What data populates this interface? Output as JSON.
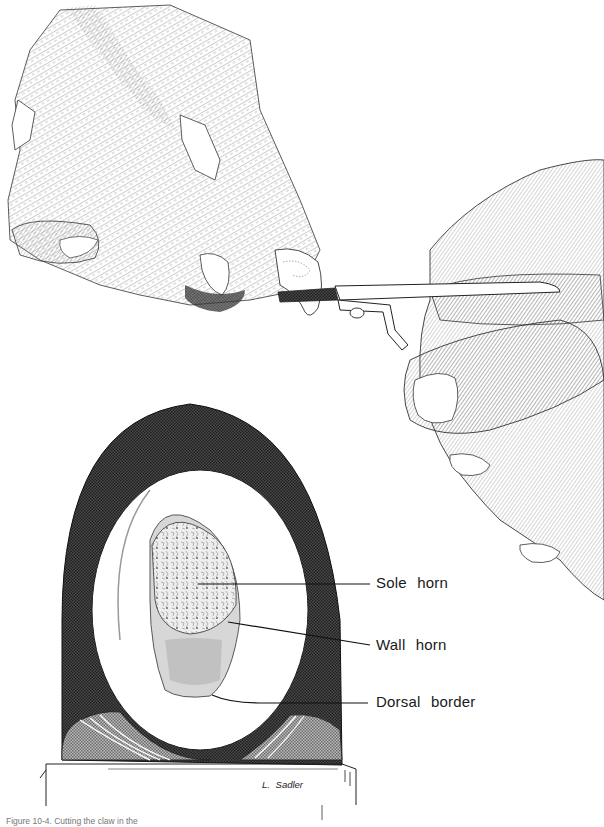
{
  "figure": {
    "upper_illustration": "Dog paw with claw being cut by nail clippers held in a human hand",
    "lower_illustration": "Cross-section of a claw",
    "labels": [
      {
        "text": "Sole horn"
      },
      {
        "text": "Wall horn"
      },
      {
        "text": "Dorsal border"
      }
    ],
    "signature": "L. Sadler",
    "caption": "Figure 10-4. Cutting the claw in the"
  },
  "colors": {
    "ink": "#1a1a1a",
    "dark_hatch": "#3a3a3a",
    "mid_hatch": "#8a8a8a",
    "paper": "#ffffff"
  }
}
